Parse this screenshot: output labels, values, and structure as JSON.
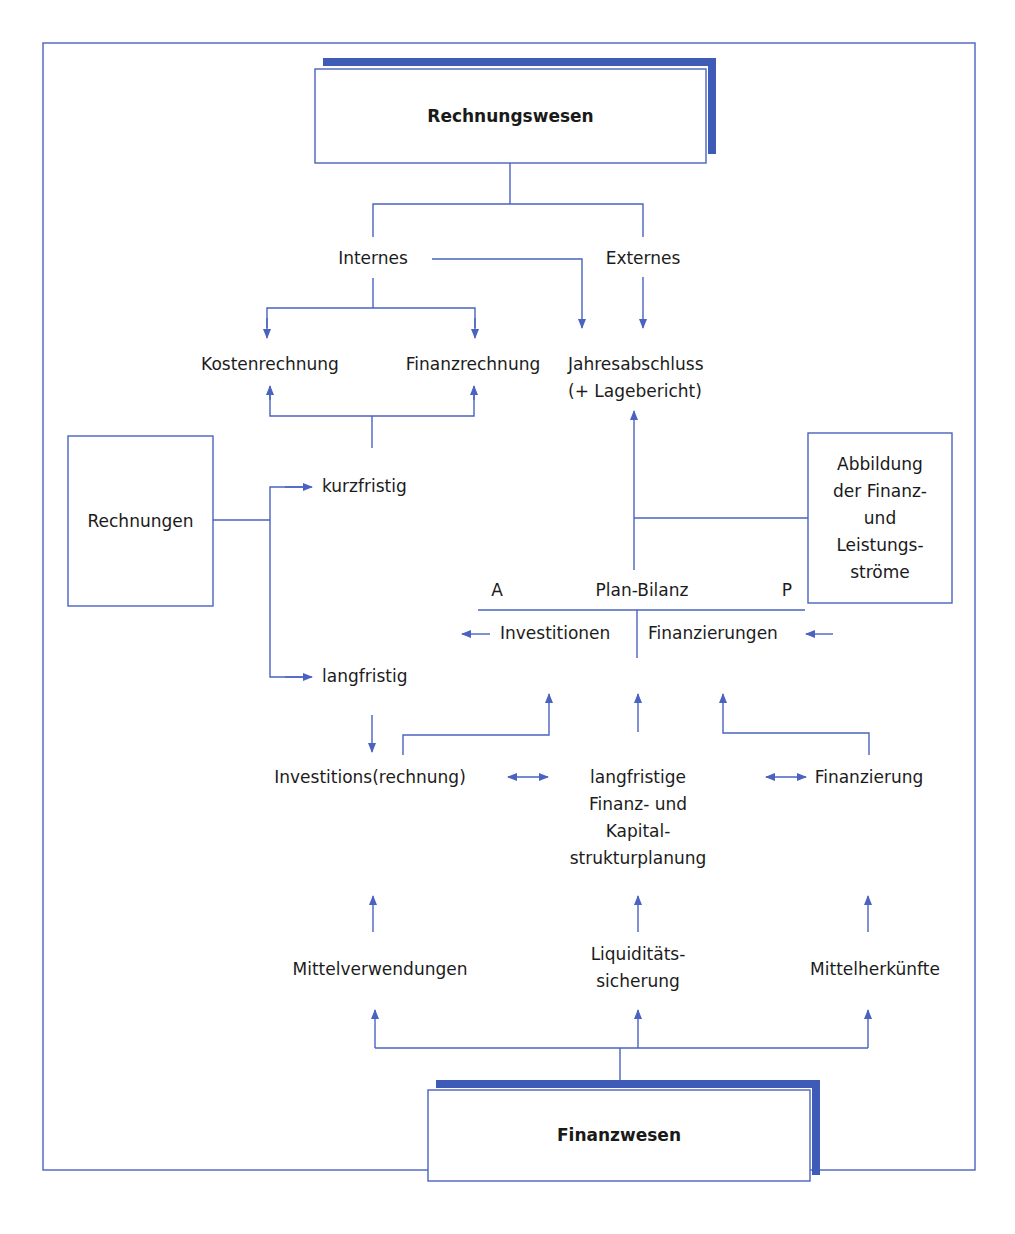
{
  "colors": {
    "line": "#4a63c0",
    "shadow": "#3e5bb8",
    "text": "#1c1c1c"
  },
  "top_box": {
    "label": "Rechnungswesen"
  },
  "bottom_box": {
    "label": "Finanzwesen"
  },
  "branches": {
    "internes": "Internes",
    "externes": "Externes"
  },
  "internal_items": {
    "kostenrechnung": "Kostenrechnung",
    "finanzrechnung": "Finanzrechnung"
  },
  "external_item": {
    "line1": "Jahresabschluss",
    "line2": "(+ Lagebericht)"
  },
  "rechnungen_box": {
    "label": "Rechnungen"
  },
  "horizons": {
    "short": "kurzfristig",
    "long": "langfristig"
  },
  "abbildung_box": {
    "lines": [
      "Abbildung",
      "der Finanz-",
      "und",
      "Leistungs-",
      "ströme"
    ]
  },
  "plan_bilanz": {
    "left_marker": "A",
    "title": "Plan-Bilanz",
    "right_marker": "P",
    "left_side": "Investitionen",
    "right_side": "Finanzierungen"
  },
  "middle_row": {
    "left": "Investitions(rechnung)",
    "center_lines": [
      "langfristige",
      "Finanz- und",
      "Kapital-",
      "strukturplanung"
    ],
    "right": "Finanzierung"
  },
  "bottom_row": {
    "left": "Mittelverwendungen",
    "center_lines": [
      "Liquiditäts-",
      "sicherung"
    ],
    "right": "Mittelherkünfte"
  }
}
